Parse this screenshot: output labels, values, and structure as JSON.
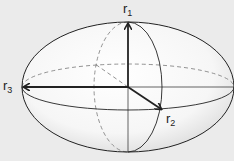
{
  "diagram": {
    "background": "#ebebeb",
    "stroke_color": "#222222",
    "dashed_color": "#777777",
    "axes": [
      {
        "id": "r1",
        "base": "r",
        "sub": "1",
        "direction": "up"
      },
      {
        "id": "r2",
        "base": "r",
        "sub": "2",
        "direction": "front-right"
      },
      {
        "id": "r3",
        "base": "r",
        "sub": "3",
        "direction": "left"
      }
    ]
  }
}
